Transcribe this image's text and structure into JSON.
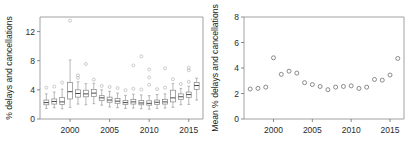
{
  "figure": {
    "panel_count": 2,
    "background": "#ffffff",
    "box_stroke": "#8a8a8a",
    "point_stroke": "#6e6e6e",
    "axis_color": "#8c8c8c"
  },
  "chart_data": [
    {
      "type": "box",
      "panel": "left",
      "title": "",
      "xlabel": "",
      "ylabel": "% delays and cancellations",
      "xlim": [
        1996.3,
        1996.3
      ],
      "ylim": [
        0,
        14
      ],
      "xticks": [
        2000,
        2005,
        2010,
        2015
      ],
      "yticks": [
        0,
        4,
        8,
        12
      ],
      "grid": false,
      "legend": "none",
      "categories": [
        1997,
        1998,
        1999,
        2000,
        2001,
        2002,
        2003,
        2004,
        2005,
        2006,
        2007,
        2008,
        2009,
        2010,
        2011,
        2012,
        2013,
        2014,
        2015,
        2016
      ],
      "boxes": [
        {
          "year": 1997,
          "whisker_low": 1.45,
          "q1": 1.95,
          "median": 2.25,
          "q3": 2.6,
          "whisker_high": 3.45,
          "outliers": [
            4.3
          ]
        },
        {
          "year": 1998,
          "whisker_low": 1.55,
          "q1": 2.05,
          "median": 2.4,
          "q3": 2.75,
          "whisker_high": 3.7,
          "outliers": [
            4.45
          ]
        },
        {
          "year": 1999,
          "whisker_low": 1.4,
          "q1": 2.0,
          "median": 2.35,
          "q3": 2.95,
          "whisker_high": 4.1,
          "outliers": [
            5.0
          ]
        },
        {
          "year": 2000,
          "whisker_low": 1.6,
          "q1": 2.75,
          "median": 3.75,
          "q3": 5.0,
          "whisker_high": 8.1,
          "outliers": [
            13.5
          ]
        },
        {
          "year": 2001,
          "whisker_low": 2.05,
          "q1": 3.0,
          "median": 3.5,
          "q3": 4.0,
          "whisker_high": 5.1,
          "outliers": [
            5.65,
            6.0
          ]
        },
        {
          "year": 2002,
          "whisker_low": 1.95,
          "q1": 3.05,
          "median": 3.45,
          "q3": 3.95,
          "whisker_high": 4.85,
          "outliers": [
            7.55
          ]
        },
        {
          "year": 2003,
          "whisker_low": 2.1,
          "q1": 3.1,
          "median": 3.55,
          "q3": 4.05,
          "whisker_high": 4.9,
          "outliers": [
            5.4
          ]
        },
        {
          "year": 2004,
          "whisker_low": 1.9,
          "q1": 2.55,
          "median": 2.9,
          "q3": 3.2,
          "whisker_high": 4.0,
          "outliers": [
            4.55
          ]
        },
        {
          "year": 2005,
          "whisker_low": 1.65,
          "q1": 2.3,
          "median": 2.6,
          "q3": 3.0,
          "whisker_high": 3.8,
          "outliers": [
            4.4
          ]
        },
        {
          "year": 2006,
          "whisker_low": 1.55,
          "q1": 2.15,
          "median": 2.45,
          "q3": 2.8,
          "whisker_high": 3.55,
          "outliers": [
            4.25
          ]
        },
        {
          "year": 2007,
          "whisker_low": 1.45,
          "q1": 2.0,
          "median": 2.25,
          "q3": 2.55,
          "whisker_high": 3.25,
          "outliers": [
            3.95
          ]
        },
        {
          "year": 2008,
          "whisker_low": 1.5,
          "q1": 2.05,
          "median": 2.35,
          "q3": 2.7,
          "whisker_high": 3.4,
          "outliers": [
            4.15,
            7.35
          ]
        },
        {
          "year": 2009,
          "whisker_low": 1.4,
          "q1": 1.95,
          "median": 2.2,
          "q3": 2.55,
          "whisker_high": 3.3,
          "outliers": [
            4.05,
            8.6
          ]
        },
        {
          "year": 2010,
          "whisker_low": 1.35,
          "q1": 1.9,
          "median": 2.15,
          "q3": 2.5,
          "whisker_high": 3.2,
          "outliers": [
            4.7,
            5.7,
            6.8
          ]
        },
        {
          "year": 2011,
          "whisker_low": 1.45,
          "q1": 2.0,
          "median": 2.3,
          "q3": 2.6,
          "whisker_high": 3.35,
          "outliers": [
            4.1
          ]
        },
        {
          "year": 2012,
          "whisker_low": 1.5,
          "q1": 2.05,
          "median": 2.35,
          "q3": 2.7,
          "whisker_high": 3.45,
          "outliers": [
            4.3,
            6.95
          ]
        },
        {
          "year": 2013,
          "whisker_low": 1.6,
          "q1": 2.35,
          "median": 2.9,
          "q3": 3.95,
          "whisker_high": 4.85,
          "outliers": [
            5.45
          ]
        },
        {
          "year": 2014,
          "whisker_low": 1.95,
          "q1": 2.7,
          "median": 3.05,
          "q3": 3.45,
          "whisker_high": 4.2,
          "outliers": [
            4.8
          ]
        },
        {
          "year": 2015,
          "whisker_low": 2.0,
          "q1": 2.95,
          "median": 3.35,
          "q3": 3.7,
          "whisker_high": 4.5,
          "outliers": [
            5.1,
            7.05,
            6.7
          ]
        },
        {
          "year": 2016,
          "whisker_low": 2.6,
          "q1": 4.05,
          "median": 4.6,
          "q3": 5.0,
          "whisker_high": 5.6,
          "outliers": []
        }
      ]
    },
    {
      "type": "scatter",
      "panel": "right",
      "title": "",
      "xlabel": "",
      "ylabel": "Mean % delays and cancellations",
      "ylim": [
        0,
        8
      ],
      "xticks": [
        2000,
        2005,
        2010,
        2015
      ],
      "yticks": [
        0,
        2,
        4,
        6,
        8
      ],
      "grid": false,
      "legend": "none",
      "marker": "open-circle",
      "x": [
        1997,
        1998,
        1999,
        2000,
        2001,
        2002,
        2003,
        2004,
        2005,
        2006,
        2007,
        2008,
        2009,
        2010,
        2011,
        2012,
        2013,
        2014,
        2015,
        2016
      ],
      "values": [
        2.35,
        2.4,
        2.5,
        4.8,
        3.5,
        3.75,
        3.6,
        2.85,
        2.7,
        2.55,
        2.3,
        2.5,
        2.55,
        2.6,
        2.4,
        2.5,
        3.1,
        3.05,
        3.45,
        4.75
      ]
    }
  ]
}
